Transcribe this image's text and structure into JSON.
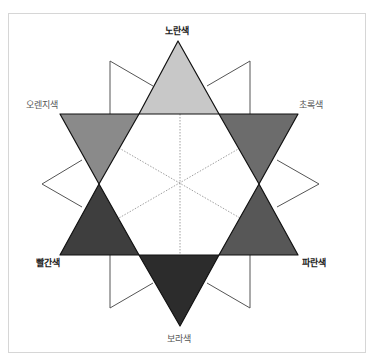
{
  "diagram": {
    "labels": {
      "yellow": "노란색",
      "orange": "오렌지색",
      "green": "초록색",
      "red": "빨간색",
      "blue": "파란색",
      "purple": "보라색"
    },
    "fills": {
      "yellow": "#c8c8c8",
      "orange": "#8a8a8a",
      "green": "#6c6c6c",
      "red": "#3e3e3e",
      "blue": "#575757",
      "purple": "#2c2c2c"
    },
    "primary_colors": [
      "노란색",
      "빨간색",
      "파란색"
    ],
    "secondary_colors": [
      "오렌지색",
      "초록색",
      "보라색"
    ]
  }
}
